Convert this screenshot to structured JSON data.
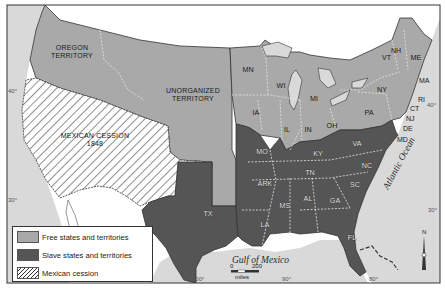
{
  "map": {
    "title": "",
    "colors": {
      "free": "#a9a9a9",
      "slave": "#555555",
      "water": "#d9d9d9",
      "foreign_land": "#ffffff",
      "border": "#333333"
    },
    "regions": {
      "oregon": "OREGON\nTERRITORY",
      "oregon_line1": "OREGON",
      "oregon_line2": "TERRITORY",
      "unorganized_line1": "UNORGANIZED",
      "unorganized_line2": "TERRITORY",
      "mexican_cession_line1": "MEXICAN CESSION",
      "mexican_cession_line2": "1848"
    },
    "states": {
      "free": [
        "MN",
        "WI",
        "MI",
        "IA",
        "IL",
        "IN",
        "OH",
        "PA",
        "NY",
        "VT",
        "NH",
        "ME",
        "MA",
        "RI",
        "CT",
        "NJ"
      ],
      "slave": [
        "MO",
        "KY",
        "VA",
        "TN",
        "NC",
        "SC",
        "ARK",
        "MS",
        "AL",
        "GA",
        "LA",
        "FL",
        "TX",
        "DE",
        "MD"
      ]
    },
    "labels": {
      "MN": "MN",
      "WI": "WI",
      "MI": "MI",
      "IA": "IA",
      "IL": "IL",
      "IN": "IN",
      "OH": "OH",
      "PA": "PA",
      "NY": "NY",
      "VT": "VT",
      "NH": "NH",
      "ME": "ME",
      "MA": "MA",
      "RI": "RI",
      "CT": "CT",
      "NJ": "NJ",
      "DE": "DE",
      "MD": "MD",
      "MO": "MO",
      "KY": "KY",
      "VA": "VA",
      "TN": "TN",
      "NC": "NC",
      "SC": "SC",
      "ARK": "ARK",
      "MS": "MS",
      "AL": "AL",
      "GA": "GA",
      "LA": "LA",
      "FL": "FL",
      "TX": "TX"
    },
    "water": {
      "gulf": "Gulf of Mexico",
      "atlantic": "Atlantic Ocean"
    },
    "coordinates": {
      "lat_40_left": "40°",
      "lat_30_left": "30°",
      "lat_40_right": "40°",
      "lat_30_right": "30°",
      "lon_100": "100°",
      "lon_90": "90°",
      "lon_80": "80°"
    },
    "scale_bar": {
      "start": "0",
      "end": "200",
      "unit": "miles"
    },
    "compass": {
      "label": "N"
    }
  },
  "legend": {
    "items": [
      {
        "label": "Free states and territories",
        "swatch": "free"
      },
      {
        "label": "Slave states and territories",
        "swatch": "slave"
      },
      {
        "label": "Mexican cession",
        "swatch": "hatch"
      }
    ]
  }
}
